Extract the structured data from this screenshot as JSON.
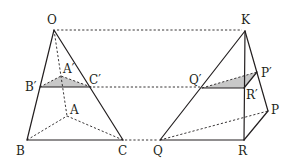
{
  "diagram": {
    "type": "geometry-two-pyramids-cross-section",
    "colors": {
      "line": "#231f20",
      "shade": "#c8c8c8",
      "background": "#ffffff"
    },
    "left_pyramid": {
      "labels": {
        "apex": "O",
        "base_left": "B",
        "base_right": "C",
        "base_back": "A",
        "section_left": "B′",
        "section_right": "C′",
        "section_back": "A′"
      }
    },
    "right_pyramid": {
      "labels": {
        "apex": "K",
        "base_left": "Q",
        "base_right": "R",
        "base_back": "P",
        "section_left": "Q′",
        "section_right": "R′",
        "section_back": "P′"
      }
    },
    "connectors": [
      "O–K",
      "C′–Q′",
      "C–Q"
    ]
  }
}
